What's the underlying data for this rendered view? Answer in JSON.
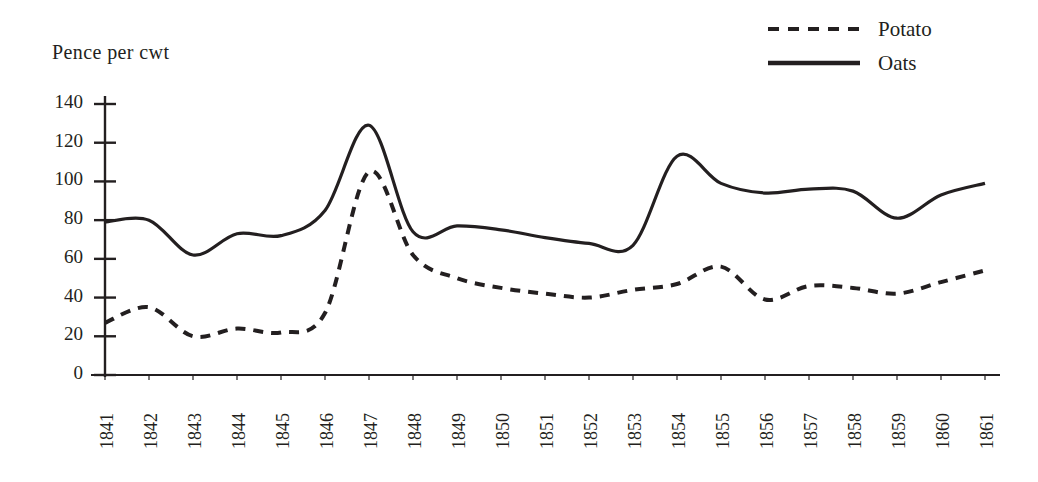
{
  "chart_data": {
    "type": "line",
    "title": "",
    "ylabel": "Pence per cwt",
    "xlabel": "",
    "ylim": [
      0,
      140
    ],
    "yticks": [
      0,
      20,
      40,
      60,
      80,
      100,
      120,
      140
    ],
    "ytick_labels": [
      "0",
      "20",
      "40",
      "60",
      "80",
      "100",
      "120",
      "140"
    ],
    "grid": false,
    "legend_position": "top-right",
    "categories": [
      1841,
      1842,
      1843,
      1844,
      1845,
      1846,
      1847,
      1848,
      1849,
      1850,
      1851,
      1852,
      1853,
      1854,
      1855,
      1856,
      1857,
      1858,
      1859,
      1860,
      1861
    ],
    "xtick_labels": [
      "1841",
      "1842",
      "1843",
      "1844",
      "1845",
      "1846",
      "1847",
      "1848",
      "1849",
      "1850",
      "1851",
      "1852",
      "1853",
      "1854",
      "1855",
      "1856",
      "1857",
      "1858",
      "1859",
      "1860",
      "1861"
    ],
    "series": [
      {
        "name": "Potato",
        "style": "dashed",
        "color": "#231f20",
        "values": [
          27,
          35,
          20,
          24,
          22,
          32,
          105,
          62,
          50,
          45,
          42,
          40,
          44,
          47,
          56,
          39,
          46,
          45,
          42,
          48,
          54
        ]
      },
      {
        "name": "Oats",
        "style": "solid",
        "color": "#231f20",
        "values": [
          79,
          80,
          62,
          73,
          72,
          85,
          129,
          74,
          77,
          75,
          71,
          68,
          67,
          113,
          99,
          94,
          96,
          95,
          81,
          93,
          99
        ]
      }
    ]
  },
  "axis_title": "Pence per cwt",
  "legend": {
    "items": [
      {
        "label": "Potato",
        "style": "dashed"
      },
      {
        "label": "Oats",
        "style": "solid"
      }
    ]
  }
}
